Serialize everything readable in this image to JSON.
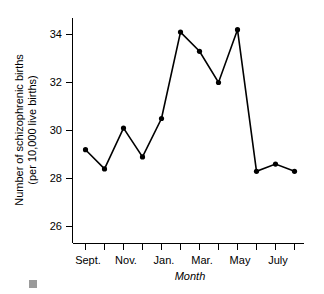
{
  "chart_data": {
    "type": "line",
    "title": "",
    "subtitle": "",
    "xlabel": "Month",
    "ylabel": "Number of schizophrenic births\n(per 10,000 live births)",
    "ylabel_line1": "Number of schizophrenic births",
    "ylabel_line2": "(per 10,000 live births)",
    "categories": [
      "Sept.",
      "Oct.",
      "Nov.",
      "Dec.",
      "Jan.",
      "Feb.",
      "Mar.",
      "Apr.",
      "May",
      "June",
      "July",
      "Aug."
    ],
    "x_tick_labels": [
      "Sept.",
      "",
      "Nov.",
      "",
      "Jan.",
      "",
      "Mar.",
      "",
      "May",
      "",
      "July",
      ""
    ],
    "x_tick_labels_visible": [
      "Sept.",
      "Nov.",
      "Jan.",
      "Mar.",
      "May",
      "July"
    ],
    "values": [
      29.2,
      28.4,
      30.1,
      28.9,
      30.5,
      34.1,
      33.3,
      32.0,
      34.2,
      28.3,
      28.6,
      28.3
    ],
    "series": [
      {
        "name": "Schizophrenic births",
        "values": [
          29.2,
          28.4,
          30.1,
          28.9,
          30.5,
          34.1,
          33.3,
          32.0,
          34.2,
          28.3,
          28.6,
          28.3
        ]
      }
    ],
    "y_tick_labels": [
      "26",
      "28",
      "30",
      "32",
      "34"
    ],
    "y_ticks": [
      26,
      28,
      30,
      32,
      34
    ],
    "ylim": [
      25.0,
      34.9
    ],
    "xlim": [
      0,
      13
    ],
    "grid": false,
    "legend": false,
    "legend_position": "none",
    "marker": "filled-circle",
    "line_color": "#000000",
    "marker_color": "#000000",
    "background_color": "#ffffff"
  },
  "figure": {
    "corner_marker_color": "#9a9a9a"
  }
}
